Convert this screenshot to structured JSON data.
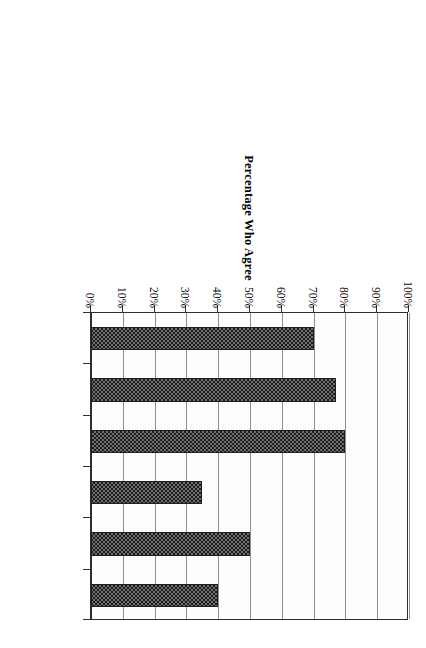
{
  "chart_data": {
    "type": "bar",
    "title": "",
    "subtitle": "",
    "orientation": "rotated-90-vertical-bars",
    "xlabel": "",
    "ylabel": "Percentage Who Agree",
    "ylim": [
      0,
      100
    ],
    "grid": true,
    "legend": "none",
    "tick_labels": [
      "0%",
      "10%",
      "20%",
      "30%",
      "40%",
      "50%",
      "60%",
      "70%",
      "80%",
      "90%",
      "100%"
    ],
    "tick_values": [
      0,
      10,
      20,
      30,
      40,
      50,
      60,
      70,
      80,
      90,
      100
    ],
    "categories": [
      "Parents face barriers to job success, despite their belief in a good education.",
      "Job discrimination exists (some to a lot).",
      "Whites either don't care about the progress of racial/ethnic minorities or want to keep them down.",
      "People in my family have not been treated fairly at work, no matterhow much education they possess.",
      "Parents and people like me are not paid or promoted based on educational standards.",
      "Studying in school rarely pays off later with good jobs."
    ],
    "values": [
      70,
      77,
      80,
      35,
      50,
      40
    ],
    "series": [
      {
        "name": "Percentage Who Agree",
        "values": [
          70,
          77,
          80,
          35,
          50,
          40
        ]
      }
    ],
    "bar_fill": "#707070",
    "bar_pattern": "checkerboard",
    "bar_border_color": "#1f1f1f",
    "gridline_color": "#8f8f8f",
    "axis_color": "#2e2e2e",
    "background": "#ffffff"
  },
  "axis": {
    "value_axis_title": "Percentage Who Agree"
  }
}
